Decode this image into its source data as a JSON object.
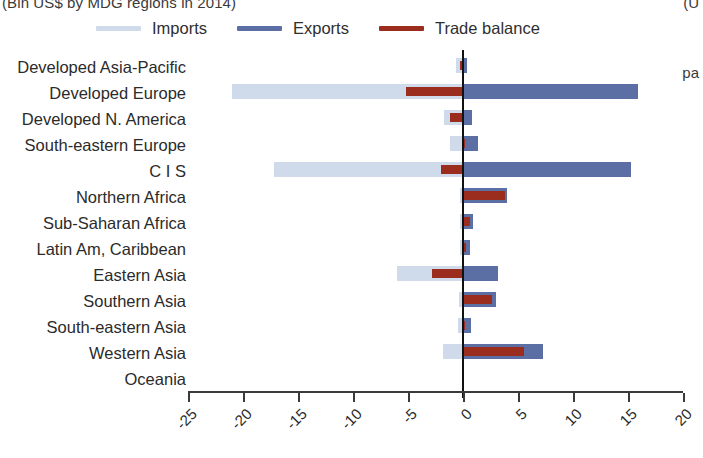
{
  "figure": {
    "title_left_clipped": "(Bln US$ by MDG regions in 2014)",
    "title_right_clipped": "(U",
    "right_margin_text_clipped": "pa"
  },
  "legend": {
    "position": "top",
    "items": [
      {
        "label": "Imports",
        "color": "#cfdaeb",
        "icon": "line-swatch-icon"
      },
      {
        "label": "Exports",
        "color": "#5c6fa4",
        "icon": "line-swatch-icon"
      },
      {
        "label": "Trade balance",
        "color": "#9b2d1f",
        "icon": "line-swatch-icon"
      }
    ]
  },
  "chart_data": {
    "type": "bar",
    "orientation": "horizontal",
    "title": "(Bln US$ by MDG regions in 2014)",
    "xlabel": "",
    "ylabel": "",
    "xlim": [
      -25,
      20
    ],
    "xticks": [
      -25,
      -20,
      -15,
      -10,
      -5,
      0,
      5,
      10,
      15,
      20
    ],
    "xtick_labels": [
      "-25",
      "-20",
      "-15",
      "-10",
      "-5",
      "0",
      "5",
      "10",
      "15",
      "20"
    ],
    "grid": false,
    "zero_line": true,
    "legend_position": "top",
    "categories": [
      "Developed Asia-Pacific",
      "Developed Europe",
      "Developed N. America",
      "South-eastern Europe",
      "C I S",
      "Northern Africa",
      "Sub-Saharan Africa",
      "Latin Am, Caribbean",
      "Eastern Asia",
      "Southern Asia",
      "South-eastern Asia",
      "Western Asia",
      "Oceania"
    ],
    "series": [
      {
        "name": "Imports",
        "color": "#cfdaeb",
        "values": [
          -0.6,
          -21.0,
          -1.7,
          -1.2,
          -17.2,
          -0.3,
          -0.3,
          -0.3,
          -6.0,
          -0.4,
          -0.5,
          -1.8,
          0.0
        ]
      },
      {
        "name": "Exports",
        "color": "#5c6fa4",
        "values": [
          0.4,
          15.9,
          0.8,
          1.4,
          15.3,
          4.0,
          0.9,
          0.6,
          3.2,
          3.0,
          0.7,
          7.3,
          0.0
        ]
      },
      {
        "name": "Trade balance",
        "color": "#9b2d1f",
        "values": [
          -0.3,
          -5.2,
          -1.2,
          0.2,
          -2.0,
          3.8,
          0.6,
          0.3,
          -2.8,
          2.6,
          0.2,
          5.5,
          0.0
        ]
      }
    ]
  }
}
